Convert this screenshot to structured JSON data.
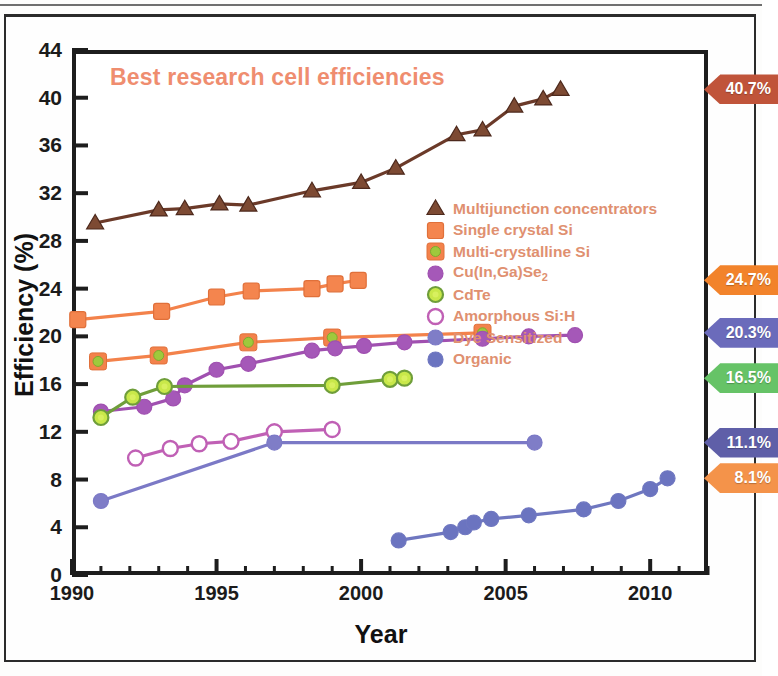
{
  "chart_data": {
    "type": "line",
    "title": "Best research cell efficiencies",
    "xlabel": "Year",
    "ylabel": "Efficiency (%)",
    "xlim": [
      1990,
      2012
    ],
    "ylim": [
      0,
      44
    ],
    "ytick_values": [
      0,
      4,
      8,
      12,
      16,
      20,
      24,
      28,
      32,
      36,
      40,
      44
    ],
    "ytick_labels": [
      "0",
      "4",
      "8",
      "12",
      "16",
      "20",
      "24",
      "28",
      "32",
      "36",
      "40",
      "44"
    ],
    "xtick_values": [
      1990,
      1995,
      2000,
      2005,
      2010
    ],
    "xtick_labels": [
      "1990",
      "1995",
      "2000",
      "2005",
      "2010"
    ],
    "x_minor_step": 1,
    "y_minor_step": 4,
    "grid": false,
    "legend_position": "center-right-inside",
    "series": [
      {
        "name": "Multijunction concentrators",
        "marker": "triangle",
        "color": "#6b3a29",
        "fill": "#7d4a33",
        "x": [
          1990.8,
          1993.0,
          1993.9,
          1995.1,
          1996.1,
          1998.3,
          2000.0,
          2001.2,
          2003.3,
          2004.2,
          2005.3,
          2006.3,
          2006.9
        ],
        "y": [
          29.5,
          30.6,
          30.7,
          31.1,
          31.0,
          32.2,
          32.9,
          34.1,
          36.9,
          37.3,
          39.3,
          39.9,
          40.7
        ]
      },
      {
        "name": "Single crystal Si",
        "marker": "square",
        "color": "#f3824b",
        "fill": "#f4854e",
        "x": [
          1990.2,
          1993.1,
          1995.0,
          1996.2,
          1998.3,
          1999.1,
          1999.9
        ],
        "y": [
          21.4,
          22.1,
          23.3,
          23.8,
          24.0,
          24.4,
          24.7
        ]
      },
      {
        "name": "Multi-crystalline Si",
        "marker": "square-green",
        "color": "#f3824b",
        "fill": "#9fc93c",
        "x": [
          1990.9,
          1993.0,
          1996.1,
          1999.0,
          2004.2
        ],
        "y": [
          17.9,
          18.4,
          19.5,
          19.9,
          20.3
        ]
      },
      {
        "name": "Cu(In,Ga)Se2",
        "marker": "circle",
        "color": "#a050b0",
        "fill": "#a558b8",
        "x": [
          1991.0,
          1992.5,
          1993.5,
          1993.9,
          1995.0,
          1996.1,
          1998.3,
          1999.1,
          2000.1,
          2001.5,
          2004.2,
          2005.8,
          2007.4
        ],
        "y": [
          13.7,
          14.1,
          14.8,
          15.9,
          17.2,
          17.7,
          18.8,
          19.0,
          19.2,
          19.5,
          19.8,
          20.0,
          20.1
        ]
      },
      {
        "name": "CdTe",
        "marker": "circle-open-green",
        "color": "#6f9e3a",
        "fill": "#c9e84a",
        "x": [
          1991.0,
          1992.1,
          1993.2,
          1999.0,
          2001.0,
          2001.5
        ],
        "y": [
          13.2,
          14.9,
          15.8,
          15.9,
          16.4,
          16.5
        ]
      },
      {
        "name": "Amorphous Si:H",
        "marker": "circle-open",
        "color": "#c060b5",
        "fill": "#ffffff",
        "x": [
          1992.2,
          1993.4,
          1994.4,
          1995.5,
          1997.0,
          1999.0
        ],
        "y": [
          9.8,
          10.6,
          11.0,
          11.2,
          12.0,
          12.2
        ]
      },
      {
        "name": "Dye Sensitized",
        "marker": "circle-dye",
        "color": "#7b79c6",
        "fill": "#7f7dc7",
        "x": [
          1991.0,
          1997.0,
          2006.0
        ],
        "y": [
          6.2,
          11.1,
          11.1
        ]
      },
      {
        "name": "Organic",
        "marker": "circle-organic",
        "color": "#6f77c0",
        "fill": "#6b74c0",
        "x": [
          2001.3,
          2003.1,
          2003.6,
          2003.9,
          2004.5,
          2005.8,
          2007.7,
          2008.9,
          2010.0,
          2010.6
        ],
        "y": [
          2.9,
          3.6,
          4.0,
          4.4,
          4.7,
          5.0,
          5.5,
          6.2,
          7.2,
          8.1
        ]
      }
    ],
    "annotations": [
      {
        "label": "40.7%",
        "value": 40.7,
        "color": "#c0543a"
      },
      {
        "label": "24.7%",
        "value": 24.7,
        "color": "#f2832b"
      },
      {
        "label": "20.3%",
        "value": 20.3,
        "color": "#6b6bbb"
      },
      {
        "label": "16.5%",
        "value": 16.5,
        "color": "#66c367"
      },
      {
        "label": "11.1%",
        "value": 11.1,
        "color": "#5f5fa8"
      },
      {
        "label": "8.1%",
        "value": 8.1,
        "color": "#f4934a"
      }
    ]
  }
}
